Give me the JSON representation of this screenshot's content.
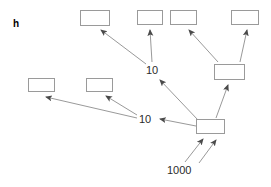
{
  "figure": {
    "panel_label": "h",
    "background_color": "#ffffff",
    "box_stroke_color": "#9a9a9a",
    "arrow_color": "#6e6e6e",
    "arrow_head_color": "#4a4a4a",
    "text_color": "#2b2b2b"
  },
  "nodes": [
    {
      "id": "top1",
      "label": "",
      "x": 80,
      "y": 10,
      "w": 30,
      "h": 16
    },
    {
      "id": "top2",
      "label": "",
      "x": 137,
      "y": 10,
      "w": 26,
      "h": 15
    },
    {
      "id": "top3",
      "label": "",
      "x": 170,
      "y": 10,
      "w": 27,
      "h": 15
    },
    {
      "id": "top4",
      "label": "",
      "x": 231,
      "y": 10,
      "w": 28,
      "h": 15
    },
    {
      "id": "left1",
      "label": "",
      "x": 28,
      "y": 78,
      "w": 27,
      "h": 14
    },
    {
      "id": "left2",
      "label": "",
      "x": 86,
      "y": 78,
      "w": 27,
      "h": 14
    },
    {
      "id": "mid_right",
      "label": "",
      "x": 214,
      "y": 64,
      "w": 31,
      "h": 16
    },
    {
      "id": "bottom_center",
      "label": "",
      "x": 196,
      "y": 119,
      "w": 29,
      "h": 15
    }
  ],
  "edge_labels": [
    {
      "id": "label_upper_10",
      "text": "10",
      "x": 146,
      "y": 65
    },
    {
      "id": "label_lower_10",
      "text": "10",
      "x": 139,
      "y": 114
    },
    {
      "id": "label_root",
      "text": "1000",
      "x": 167,
      "y": 165
    }
  ],
  "edges": [
    {
      "id": "root-to-bottom-left",
      "from": "1000",
      "to": "bottom_center"
    },
    {
      "id": "root-to-bottom-right",
      "from": "1000",
      "to": "bottom_center"
    },
    {
      "id": "bottom-to-upper10",
      "from": "bottom_center",
      "to": "upper_10"
    },
    {
      "id": "bottom-to-midright",
      "from": "bottom_center",
      "to": "mid_right"
    },
    {
      "id": "bottom-to-lower10",
      "from": "bottom_center",
      "to": "lower_10"
    },
    {
      "id": "upper10-to-top1",
      "from": "upper_10",
      "to": "top1"
    },
    {
      "id": "upper10-to-top2",
      "from": "upper_10",
      "to": "top2"
    },
    {
      "id": "midright-to-top3",
      "from": "mid_right",
      "to": "top3"
    },
    {
      "id": "midright-to-top4",
      "from": "mid_right",
      "to": "top4"
    },
    {
      "id": "lower10-to-left1",
      "from": "lower_10",
      "to": "left1"
    },
    {
      "id": "lower10-to-left2",
      "from": "lower_10",
      "to": "left2"
    }
  ]
}
